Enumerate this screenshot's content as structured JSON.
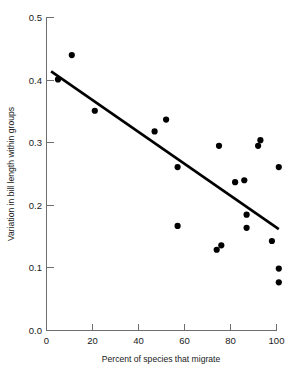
{
  "chart_data": {
    "type": "scatter",
    "title": "",
    "xlabel": "Percent of species that migrate",
    "ylabel": "Variation in bill length within groups",
    "xlim": [
      0,
      103
    ],
    "ylim": [
      0.0,
      0.5
    ],
    "xticks": [
      0,
      20,
      40,
      60,
      80,
      100
    ],
    "xtick_labels": [
      "0",
      "20",
      "40",
      "60",
      "80",
      "100"
    ],
    "yticks": [
      0.0,
      0.1,
      0.2,
      0.3,
      0.4,
      0.5
    ],
    "ytick_labels": [
      "0.0",
      "0.1",
      "0.2",
      "0.3",
      "0.4",
      "0.5"
    ],
    "grid": false,
    "legend": null,
    "marker": "filled-circle",
    "marker_color": "#000000",
    "points": [
      {
        "x": 11,
        "y": 0.44
      },
      {
        "x": 5,
        "y": 0.401
      },
      {
        "x": 21,
        "y": 0.351
      },
      {
        "x": 47,
        "y": 0.318
      },
      {
        "x": 52,
        "y": 0.337
      },
      {
        "x": 57,
        "y": 0.261
      },
      {
        "x": 57,
        "y": 0.167
      },
      {
        "x": 75,
        "y": 0.295
      },
      {
        "x": 74,
        "y": 0.129
      },
      {
        "x": 76,
        "y": 0.136
      },
      {
        "x": 82,
        "y": 0.237
      },
      {
        "x": 86,
        "y": 0.24
      },
      {
        "x": 87,
        "y": 0.185
      },
      {
        "x": 87,
        "y": 0.164
      },
      {
        "x": 92,
        "y": 0.295
      },
      {
        "x": 93,
        "y": 0.304
      },
      {
        "x": 98,
        "y": 0.143
      },
      {
        "x": 101,
        "y": 0.261
      },
      {
        "x": 101,
        "y": 0.099
      },
      {
        "x": 101,
        "y": 0.077
      }
    ],
    "trend_line": {
      "type": "linear-fit",
      "x_start": 2,
      "y_start": 0.414,
      "x_end": 101,
      "y_end": 0.162,
      "color": "#000000"
    }
  }
}
